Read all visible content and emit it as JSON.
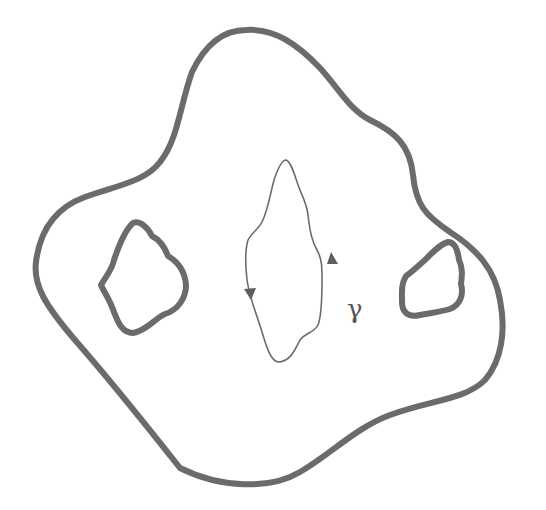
{
  "figure": {
    "labels": {
      "curve": "γ"
    },
    "elements": {
      "outer_boundary": "outer-boundary-curve",
      "holes": [
        "left-hole",
        "right-hole"
      ],
      "closed_curve": "gamma-curve",
      "orientation_arrows": [
        "arrow-down-left",
        "arrow-up-right"
      ]
    },
    "colors": {
      "stroke": "#6b6b6b",
      "background": "#ffffff"
    }
  }
}
